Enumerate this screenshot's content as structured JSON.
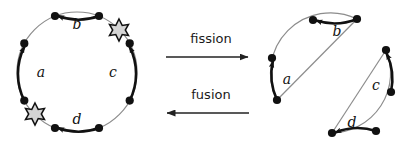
{
  "figure": {
    "background_color": "#ffffff",
    "colors": {
      "circle_stroke": "#8c8c8c",
      "arrow_stroke": "#111111",
      "node_fill": "#111111",
      "star_fill": "#d4d4d4",
      "star_stroke": "#111111",
      "op_arrow": "#222222",
      "text": "#1a1a1a"
    }
  },
  "left_panel": {
    "name": "fused-cycle",
    "circle": {
      "cx": 77,
      "cy": 72,
      "r": 60
    },
    "nodes": [
      {
        "id": "n1",
        "cx": 24.3,
        "cy": 43.4
      },
      {
        "id": "n2",
        "cx": 24.3,
        "cy": 100.6
      },
      {
        "id": "n3",
        "cx": 55.0,
        "cy": 128.0
      },
      {
        "id": "n4",
        "cx": 99.0,
        "cy": 128.0
      },
      {
        "id": "n5",
        "cx": 129.7,
        "cy": 100.6
      },
      {
        "id": "n6",
        "cx": 129.7,
        "cy": 43.4
      },
      {
        "id": "n7",
        "cx": 99.0,
        "cy": 16.0
      },
      {
        "id": "n8",
        "cx": 55.0,
        "cy": 16.0
      }
    ],
    "arcs": [
      {
        "label": "a",
        "position": "left",
        "direction": "up",
        "label_x": 41,
        "label_y": 77
      },
      {
        "label": "b",
        "position": "top",
        "direction": "left",
        "label_x": 77,
        "label_y": 29
      },
      {
        "label": "c",
        "position": "right",
        "direction": "up",
        "label_x": 113,
        "label_y": 77
      },
      {
        "label": "d",
        "position": "bottom",
        "direction": "left",
        "label_x": 77,
        "label_y": 128
      }
    ],
    "stars": [
      {
        "id": "star-upper-right",
        "cx": 119,
        "cy": 30,
        "points": 6
      },
      {
        "id": "star-lower-left",
        "cx": 35,
        "cy": 114,
        "points": 6
      }
    ]
  },
  "operations": [
    {
      "name": "fission",
      "label": "fission",
      "direction": "right",
      "label_x": 211,
      "label_y": 43,
      "arrow_y": 57,
      "arrow_x1": 166,
      "arrow_x2": 249
    },
    {
      "name": "fusion",
      "label": "fusion",
      "direction": "left",
      "label_x": 211,
      "label_y": 99,
      "arrow_y": 113,
      "arrow_x1": 249,
      "arrow_x2": 166
    }
  ],
  "right_panel": {
    "name": "fissioned-arcs",
    "pieces": [
      {
        "id": "piece-upper-left",
        "nodes": [
          {
            "id": "p1n1",
            "cx": 277,
            "cy": 100
          },
          {
            "id": "p1n2",
            "cx": 272,
            "cy": 58
          },
          {
            "id": "p1n3",
            "cx": 313,
            "cy": 20
          },
          {
            "id": "p1n4",
            "cx": 357,
            "cy": 19
          }
        ],
        "arcs": [
          {
            "label": "a",
            "direction": "up",
            "label_x": 285,
            "label_y": 84
          },
          {
            "label": "b",
            "direction": "left",
            "label_x": 337,
            "label_y": 34
          }
        ]
      },
      {
        "id": "piece-lower-right",
        "nodes": [
          {
            "id": "p2n1",
            "cx": 332,
            "cy": 133
          },
          {
            "id": "p2n2",
            "cx": 376,
            "cy": 131
          },
          {
            "id": "p2n3",
            "cx": 391,
            "cy": 92
          },
          {
            "id": "p2n4",
            "cx": 386,
            "cy": 50
          }
        ],
        "arcs": [
          {
            "label": "c",
            "direction": "up",
            "label_x": 378,
            "label_y": 90
          },
          {
            "label": "d",
            "direction": "left",
            "label_x": 352,
            "label_y": 128
          }
        ]
      }
    ]
  }
}
